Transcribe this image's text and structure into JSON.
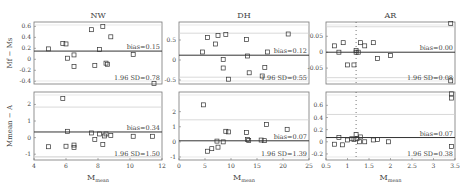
{
  "figure": {
    "row_labels": {
      "top": "M_f − M_s",
      "bottom": "M_mean − A"
    },
    "xlabel": "M_mean"
  },
  "chart_data": [
    {
      "type": "scatter",
      "panel": "NW-top",
      "title": "NW",
      "ylabel": "M_f − M_s",
      "xlabel": "",
      "xlim": [
        4,
        12
      ],
      "ylim": [
        -0.45,
        0.68
      ],
      "yticks": [
        -0.4,
        -0.2,
        0,
        0.2,
        0.4,
        0.6
      ],
      "ytick_labels": [
        "-0.4",
        "-0.2",
        "0",
        "0.2",
        "0.4",
        "0.6"
      ],
      "bias": 0.15,
      "bias_label": "bias=0.15",
      "sd_label": "1.96 SD=0.78",
      "loa_upper": 0.93,
      "loa_lower": -0.63,
      "points": [
        [
          4.9,
          0.19
        ],
        [
          5.8,
          0.29
        ],
        [
          6.0,
          0.28
        ],
        [
          6.1,
          0.02
        ],
        [
          6.5,
          0.08
        ],
        [
          6.5,
          -0.13
        ],
        [
          7.6,
          0.54
        ],
        [
          7.8,
          -0.11
        ],
        [
          8.1,
          0.18
        ],
        [
          8.3,
          0.6
        ],
        [
          8.5,
          -0.07
        ],
        [
          8.6,
          -0.09
        ],
        [
          8.8,
          0.41
        ],
        [
          10.2,
          0.09
        ],
        [
          11.5,
          -0.44
        ]
      ]
    },
    {
      "type": "scatter",
      "panel": "DH-top",
      "title": "DH",
      "xlabel": "",
      "xlim": [
        0,
        25
      ],
      "ylim": [
        -0.6,
        0.95
      ],
      "yticks": [
        -0.5,
        0,
        0.5
      ],
      "ytick_labels": [
        "-0.5",
        "0",
        "0.5"
      ],
      "bias": 0.12,
      "bias_label": "bias=0.12",
      "sd_label": "1.96 SD=0.55",
      "loa_upper": 0.67,
      "loa_lower": -0.43,
      "points": [
        [
          4.5,
          0.2
        ],
        [
          5.5,
          0.56
        ],
        [
          7.0,
          0.4
        ],
        [
          7.5,
          0.61
        ],
        [
          8.5,
          -0.2
        ],
        [
          8.5,
          0.01
        ],
        [
          9.0,
          0.64
        ],
        [
          9.5,
          -0.48
        ],
        [
          13.0,
          0.51
        ],
        [
          13.2,
          0.1
        ],
        [
          13.5,
          -0.32
        ],
        [
          16.0,
          -0.4
        ],
        [
          16.5,
          -0.19
        ],
        [
          17.0,
          0.2
        ],
        [
          21.0,
          0.65
        ]
      ]
    },
    {
      "type": "scatter",
      "panel": "AR-top",
      "title": "AR",
      "xlabel": "",
      "xlim": [
        0.5,
        3.5
      ],
      "ylim": [
        -0.1,
        0.095
      ],
      "yticks": [
        -0.05,
        0,
        0.05
      ],
      "ytick_labels": [
        "-0.05",
        "0",
        "0.05"
      ],
      "bias": 0.0,
      "bias_label": "bias=0.00",
      "sd_label": "1.96 SD=0.08",
      "loa_upper": 0.08,
      "loa_lower": -0.08,
      "vline_x": 1.2,
      "points": [
        [
          0.7,
          0.02
        ],
        [
          0.8,
          0.0
        ],
        [
          0.9,
          0.03
        ],
        [
          1.0,
          -0.04
        ],
        [
          1.15,
          -0.04
        ],
        [
          1.2,
          0.0
        ],
        [
          1.2,
          0.005
        ],
        [
          1.25,
          0.0
        ],
        [
          1.3,
          0.03
        ],
        [
          1.4,
          0.02
        ],
        [
          1.6,
          0.03
        ],
        [
          1.7,
          -0.02
        ],
        [
          2.0,
          -0.01
        ],
        [
          3.4,
          0.09
        ],
        [
          3.4,
          -0.09
        ]
      ]
    },
    {
      "type": "scatter",
      "panel": "NW-bottom",
      "ylabel": "M_mean − A",
      "xlabel": "M_mean",
      "xlim": [
        4,
        12
      ],
      "xticks": [
        4,
        6,
        8,
        10,
        12
      ],
      "ylim": [
        -1.35,
        2.75
      ],
      "yticks": [
        -1,
        0,
        1,
        2
      ],
      "ytick_labels": [
        "-1",
        "0",
        "1",
        "2"
      ],
      "bias": 0.34,
      "bias_label": "bias=0.34",
      "sd_label": "1.96 SD=1.50",
      "loa_upper": 1.84,
      "loa_lower": -1.16,
      "points": [
        [
          4.9,
          -0.55
        ],
        [
          5.8,
          2.35
        ],
        [
          6.0,
          -0.52
        ],
        [
          6.1,
          0.38
        ],
        [
          6.5,
          -0.45
        ],
        [
          6.5,
          -0.6
        ],
        [
          7.6,
          0.28
        ],
        [
          7.8,
          -0.12
        ],
        [
          8.1,
          0.22
        ],
        [
          8.3,
          -0.42
        ],
        [
          8.4,
          0.1
        ],
        [
          8.5,
          0.22
        ],
        [
          8.8,
          0.12
        ],
        [
          10.2,
          0.08
        ],
        [
          11.4,
          0.08
        ]
      ]
    },
    {
      "type": "scatter",
      "panel": "DH-bottom",
      "xlabel": "M_mean",
      "xlim": [
        0,
        25
      ],
      "xticks": [
        0,
        5,
        10,
        15,
        20,
        25
      ],
      "ylim": [
        -1.2,
        3.3
      ],
      "yticks": [
        -1,
        0,
        1,
        2
      ],
      "ytick_labels": [
        "-1",
        "0",
        "1",
        "2"
      ],
      "bias": 0.07,
      "bias_label": "bias=0.07",
      "sd_label": "1.96 SD=1.39",
      "loa_upper": 1.46,
      "loa_lower": -1.32,
      "points": [
        [
          4.7,
          2.45
        ],
        [
          5.5,
          -0.62
        ],
        [
          6.3,
          -0.45
        ],
        [
          7.3,
          0.05
        ],
        [
          7.5,
          -0.35
        ],
        [
          8.5,
          0.0
        ],
        [
          9.0,
          0.7
        ],
        [
          9.5,
          0.66
        ],
        [
          13.0,
          0.62
        ],
        [
          13.2,
          0.15
        ],
        [
          13.4,
          0.1
        ],
        [
          15.8,
          0.12
        ],
        [
          16.4,
          0.08
        ],
        [
          16.8,
          1.15
        ],
        [
          20.8,
          0.83
        ]
      ]
    },
    {
      "type": "scatter",
      "panel": "AR-bottom",
      "xlabel": "M_mean",
      "xlim": [
        0.5,
        3.5
      ],
      "xticks": [
        0.5,
        1,
        1.5,
        2,
        2.5,
        3,
        3.5
      ],
      "xtick_labels": [
        "0.5",
        "1",
        "1.5",
        "2",
        "2.5",
        "3",
        "3.5"
      ],
      "ylim": [
        -0.3,
        0.82
      ],
      "yticks": [
        -0.2,
        0,
        0.2,
        0.4,
        0.6
      ],
      "ytick_labels": [
        "-0.2",
        "0",
        "0.2",
        "0.4",
        "0.6"
      ],
      "bias": 0.07,
      "bias_label": "bias=0.07",
      "sd_label": "1.96 SD=0.38",
      "loa_upper": 0.45,
      "loa_lower": -0.31,
      "vline_x": 1.2,
      "points": [
        [
          0.7,
          -0.04
        ],
        [
          0.8,
          0.07
        ],
        [
          0.88,
          -0.05
        ],
        [
          1.0,
          0.03
        ],
        [
          1.1,
          0.05
        ],
        [
          1.15,
          0.04
        ],
        [
          1.2,
          0.12
        ],
        [
          1.22,
          0.05
        ],
        [
          1.28,
          0.0
        ],
        [
          1.3,
          0.08
        ],
        [
          1.4,
          0.0
        ],
        [
          1.6,
          0.03
        ],
        [
          1.7,
          0.04
        ],
        [
          1.95,
          0.0
        ],
        [
          3.42,
          0.79
        ],
        [
          3.42,
          0.72
        ],
        [
          3.42,
          -0.08
        ]
      ]
    }
  ]
}
